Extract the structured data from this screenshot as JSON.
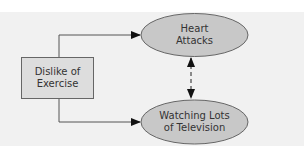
{
  "diagram": {
    "nodes": [
      {
        "id": "dislike",
        "shape": "rectangle",
        "lines": [
          "Dislike of",
          "Exercise"
        ]
      },
      {
        "id": "heart",
        "shape": "ellipse",
        "lines": [
          "Heart",
          "Attacks"
        ]
      },
      {
        "id": "tv",
        "shape": "ellipse",
        "lines": [
          "Watching Lots",
          "of Television"
        ]
      }
    ],
    "edges": [
      {
        "from": "dislike",
        "to": "heart",
        "style": "solid",
        "direction": "forward"
      },
      {
        "from": "dislike",
        "to": "tv",
        "style": "solid",
        "direction": "forward"
      },
      {
        "from": "heart",
        "to": "tv",
        "style": "dashed",
        "direction": "both"
      }
    ],
    "colors": {
      "panel": "#f1f1f1",
      "node_fill_ellipse": "#c8c8c8",
      "node_fill_box": "#dddddd",
      "stroke": "#555555",
      "text": "#333333"
    }
  }
}
